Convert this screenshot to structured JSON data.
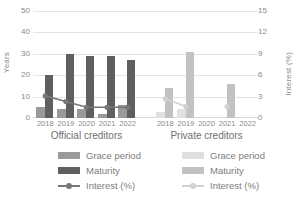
{
  "chart_data": {
    "type": "bar",
    "title": "",
    "categories": [
      "2018",
      "2019",
      "2020",
      "2021",
      "2022"
    ],
    "groups": [
      {
        "name": "Official creditors",
        "series": [
          {
            "name": "Grace period",
            "unit": "Years",
            "axis": "left",
            "color": "#9a9a9a",
            "values": [
              5,
              4,
              4,
              2,
              6
            ]
          },
          {
            "name": "Maturity",
            "unit": "Years",
            "axis": "left",
            "color": "#5f5f5f",
            "values": [
              20,
              30,
              29,
              29,
              27
            ]
          },
          {
            "name": "Interest (%)",
            "unit": "%",
            "axis": "right",
            "color": "#777777",
            "values": [
              3.1,
              2.3,
              1.5,
              1.5,
              1.5
            ]
          }
        ]
      },
      {
        "name": "Private creditors",
        "series": [
          {
            "name": "Grace period",
            "unit": "Years",
            "axis": "left",
            "color": "#e0e0e0",
            "values": [
              3,
              4,
              null,
              null,
              null
            ]
          },
          {
            "name": "Maturity",
            "unit": "Years",
            "axis": "left",
            "color": "#c2c2c2",
            "values": [
              14,
              31,
              null,
              16,
              null
            ]
          },
          {
            "name": "Interest (%)",
            "unit": "%",
            "axis": "right",
            "color": "#d0d0d0",
            "values": [
              2.7,
              1.6,
              null,
              1.6,
              null
            ]
          }
        ]
      }
    ],
    "y_left": {
      "label": "Years",
      "min": 0,
      "max": 50,
      "ticks": [
        0,
        10,
        20,
        30,
        40,
        50
      ]
    },
    "y_right": {
      "label": "Interest (%)",
      "min": 0,
      "max": 15,
      "ticks": [
        0,
        3,
        6,
        9,
        12,
        15
      ]
    },
    "xlabel": "",
    "grid": true,
    "legend_position": "bottom"
  },
  "axes": {
    "left_label": "Years",
    "right_label": "Interest (%)",
    "left_ticks": [
      "50",
      "40",
      "30",
      "20",
      "10",
      "0"
    ],
    "right_ticks": [
      "15",
      "12",
      "9",
      "6",
      "3",
      "0"
    ]
  },
  "groups": {
    "official": {
      "title": "Official creditors",
      "years": [
        "2018",
        "2019",
        "2020",
        "2021",
        "2022"
      ],
      "legend": {
        "grace": "Grace period",
        "maturity": "Maturity",
        "interest": "Interest (%)"
      }
    },
    "private": {
      "title": "Private creditors",
      "years": [
        "2018",
        "2019",
        "2020",
        "2021",
        "2022"
      ],
      "legend": {
        "grace": "Grace period",
        "maturity": "Maturity",
        "interest": "Interest (%)"
      }
    }
  },
  "colors": {
    "official_grace": "#9a9a9a",
    "official_maturity": "#5f5f5f",
    "official_interest": "#777777",
    "private_grace": "#e0e0e0",
    "private_maturity": "#c2c2c2",
    "private_interest": "#d0d0d0",
    "grid": "#e3e3e3",
    "text": "#8a8a8a"
  }
}
